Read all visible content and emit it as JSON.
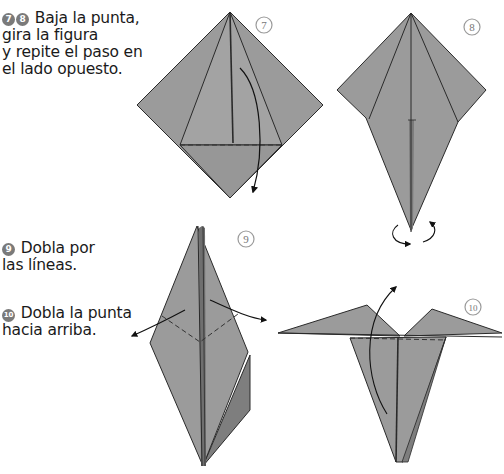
{
  "captions": {
    "step78": {
      "badges": [
        "7",
        "8"
      ],
      "lines": [
        "Baja la punta,",
        "gira la figura",
        "y repite el paso en",
        "el lado opuesto."
      ]
    },
    "step9": {
      "badge": "9",
      "lines": [
        "Dobla por",
        "las líneas."
      ]
    },
    "step10": {
      "badge": "10",
      "lines": [
        "Dobla la punta",
        "hacia arriba."
      ]
    }
  },
  "diagrams": [
    {
      "step": "7",
      "label": "7"
    },
    {
      "step": "8",
      "label": "8"
    },
    {
      "step": "9",
      "label": "9"
    },
    {
      "step": "10",
      "label": "10"
    }
  ],
  "colors": {
    "paper": "#9b9b9b",
    "paper_dark": "#7e7e7e",
    "line": "#2a2a2a",
    "badge_stroke": "#9a9a9a",
    "badge_text": "#777777"
  }
}
